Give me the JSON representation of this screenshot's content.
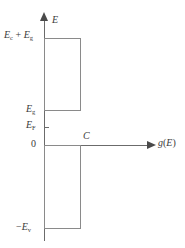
{
  "figure": {
    "name": "density-of-states-diagram",
    "background_color": "#ffffff",
    "line_color": "#6b6b6b",
    "rect_border_color": "#8a8a8a",
    "text_color": "#3a3a3a"
  },
  "axes": {
    "y": {
      "label": "E",
      "label_plain": "E",
      "direction": "up",
      "arrow": "arrow-up"
    },
    "x": {
      "label_prefix": "g",
      "label_open": "(",
      "label_arg": "E",
      "label_close": ")",
      "label_plain": "g(E)",
      "direction": "right",
      "arrow": "arrow-right"
    }
  },
  "labels": {
    "ec_plus_eg": {
      "base1": "E",
      "sub1": "c",
      "operator": " + ",
      "base2": "E",
      "sub2": "g",
      "plain": "Ec + Eg"
    },
    "eg": {
      "base": "E",
      "sub": "g",
      "plain": "Eg"
    },
    "ef": {
      "base": "E",
      "sub": "F",
      "plain": "EF"
    },
    "zero": {
      "plain": "0"
    },
    "minus_ev": {
      "sign": "−",
      "base": "E",
      "sub": "v",
      "plain": "−Ev"
    },
    "c_width": {
      "plain": "C"
    }
  },
  "chart_data": {
    "type": "area",
    "title": "",
    "xlabel": "g(E)",
    "ylabel": "E",
    "grid": false,
    "legend": "none",
    "xlim": [
      0,
      1.6
    ],
    "ylim": [
      -0.78,
      1.2
    ],
    "y_tick_labels": [
      "Ec + Eg",
      "Eg",
      "EF",
      "0",
      "−Ev"
    ],
    "y_tick_values": [
      1.0,
      0.33,
      0.165,
      0,
      -0.78
    ],
    "annotations": [
      {
        "text": "C",
        "x": 0.41,
        "y": 0.07
      }
    ],
    "series": [
      {
        "name": "conduction-band",
        "type": "rectangle",
        "x_start": 0,
        "x_end": 0.37,
        "y_bottom": 0.33,
        "y_top": 1.0,
        "value_label": "C"
      },
      {
        "name": "valence-band",
        "type": "rectangle",
        "x_start": 0,
        "x_end": 0.37,
        "y_bottom": -0.78,
        "y_top": 0,
        "value_label": "C"
      }
    ]
  }
}
